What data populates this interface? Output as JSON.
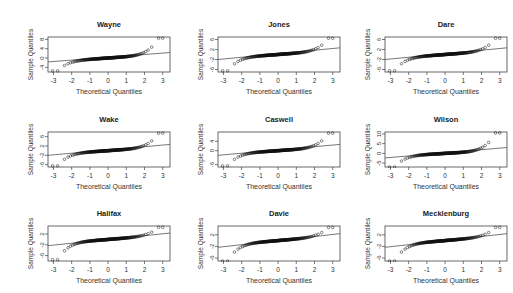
{
  "figure": {
    "xlabel": "Theoretical Quantiles",
    "ylabel": "Sample Quantiles",
    "xticks": [
      -3,
      -2,
      -1,
      0,
      1,
      2,
      3
    ]
  },
  "panels": [
    {
      "title": "Wayne",
      "yticks": [
        "-4",
        "0",
        "4",
        "8"
      ],
      "ylim": [
        -6,
        9
      ]
    },
    {
      "title": "Jones",
      "yticks": [
        "-6",
        "-2",
        "2",
        "6"
      ],
      "ylim": [
        -7,
        7
      ]
    },
    {
      "title": "Dare",
      "yticks": [
        "-6",
        "-2",
        "2",
        "6"
      ],
      "ylim": [
        -7,
        7
      ]
    },
    {
      "title": "Wake",
      "yticks": [
        "-6",
        "-2",
        "2",
        "6"
      ],
      "ylim": [
        -7,
        8
      ]
    },
    {
      "title": "Caswell",
      "yticks": [
        "-6",
        "0",
        "4"
      ],
      "ylim": [
        -7,
        8
      ]
    },
    {
      "title": "Wilson",
      "yticks": [
        "-5",
        "0",
        "5",
        "10"
      ],
      "ylim": [
        -7,
        11
      ]
    },
    {
      "title": "Halifax",
      "yticks": [
        "-6",
        "-2",
        "2"
      ],
      "ylim": [
        -8,
        5
      ]
    },
    {
      "title": "Davie",
      "yticks": [
        "-6",
        "-2",
        "2"
      ],
      "ylim": [
        -7,
        5
      ]
    },
    {
      "title": "Mecklenburg",
      "yticks": [
        "-6",
        "-2",
        "2"
      ],
      "ylim": [
        -7,
        5
      ]
    }
  ],
  "chart_data": [
    {
      "type": "scatter",
      "title": "Wayne",
      "xlabel": "Theoretical Quantiles",
      "ylabel": "Sample Quantiles",
      "xlim": [
        -3.3,
        3.4
      ],
      "ylim": [
        -6,
        9
      ],
      "qq_line": {
        "slope": 0.6,
        "intercept": 0.3
      },
      "tails": {
        "low": -5.5,
        "high": 8.5
      }
    },
    {
      "type": "scatter",
      "title": "Jones",
      "xlabel": "Theoretical Quantiles",
      "ylabel": "Sample Quantiles",
      "xlim": [
        -3.3,
        3.4
      ],
      "ylim": [
        -7,
        7
      ],
      "qq_line": {
        "slope": 0.7,
        "intercept": 0.3
      },
      "tails": {
        "low": -6.5,
        "high": 6.5
      }
    },
    {
      "type": "scatter",
      "title": "Dare",
      "xlabel": "Theoretical Quantiles",
      "ylabel": "Sample Quantiles",
      "xlim": [
        -3.3,
        3.4
      ],
      "ylim": [
        -7,
        7
      ],
      "qq_line": {
        "slope": 0.7,
        "intercept": 0.3
      },
      "tails": {
        "low": -6.5,
        "high": 6.5
      }
    },
    {
      "type": "scatter",
      "title": "Wake",
      "xlabel": "Theoretical Quantiles",
      "ylabel": "Sample Quantiles",
      "xlim": [
        -3.3,
        3.4
      ],
      "ylim": [
        -7,
        8
      ],
      "qq_line": {
        "slope": 0.7,
        "intercept": 0.3
      },
      "tails": {
        "low": -6.5,
        "high": 7.5
      }
    },
    {
      "type": "scatter",
      "title": "Caswell",
      "xlabel": "Theoretical Quantiles",
      "ylabel": "Sample Quantiles",
      "xlim": [
        -3.3,
        3.4
      ],
      "ylim": [
        -7,
        8
      ],
      "qq_line": {
        "slope": 0.7,
        "intercept": 0.3
      },
      "tails": {
        "low": -6.5,
        "high": 7.5
      }
    },
    {
      "type": "scatter",
      "title": "Wilson",
      "xlabel": "Theoretical Quantiles",
      "ylabel": "Sample Quantiles",
      "xlim": [
        -3.3,
        3.4
      ],
      "ylim": [
        -7,
        11
      ],
      "qq_line": {
        "slope": 0.8,
        "intercept": 0.3
      },
      "tails": {
        "low": -7,
        "high": 10.5
      }
    },
    {
      "type": "scatter",
      "title": "Halifax",
      "xlabel": "Theoretical Quantiles",
      "ylabel": "Sample Quantiles",
      "xlim": [
        -3.3,
        3.4
      ],
      "ylim": [
        -8,
        5
      ],
      "qq_line": {
        "slope": 0.7,
        "intercept": 0.0
      },
      "tails": {
        "low": -7.5,
        "high": 4.5
      }
    },
    {
      "type": "scatter",
      "title": "Davie",
      "xlabel": "Theoretical Quantiles",
      "ylabel": "Sample Quantiles",
      "xlim": [
        -3.3,
        3.4
      ],
      "ylim": [
        -7,
        5
      ],
      "qq_line": {
        "slope": 0.7,
        "intercept": 0.0
      },
      "tails": {
        "low": -7,
        "high": 4.5
      }
    },
    {
      "type": "scatter",
      "title": "Mecklenburg",
      "xlabel": "Theoretical Quantiles",
      "ylabel": "Sample Quantiles",
      "xlim": [
        -3.3,
        3.4
      ],
      "ylim": [
        -7,
        5
      ],
      "qq_line": {
        "slope": 0.7,
        "intercept": 0.0
      },
      "tails": {
        "low": -7,
        "high": 4.5
      }
    }
  ]
}
